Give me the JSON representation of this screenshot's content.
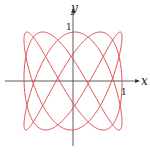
{
  "chart_data": {
    "type": "line",
    "kind": "parametric-lissajous",
    "title": "",
    "xlabel": "x",
    "ylabel": "y",
    "x_tick_labels": [
      "1"
    ],
    "y_tick_labels": [
      "1"
    ],
    "xlim": [
      -1,
      1
    ],
    "ylim": [
      -1,
      1
    ],
    "grid": false,
    "legend": null,
    "series": [
      {
        "name": "curve",
        "x_expr": "sin(3t)",
        "y_expr": "sin(5t)",
        "a": 3,
        "b": 5,
        "phase": 0.35,
        "t_range": [
          0,
          6.2832
        ],
        "color": "#e0474c"
      }
    ]
  },
  "axes": {
    "x_label": "x",
    "y_label": "y",
    "x_tick": "1",
    "y_tick": "1",
    "axis_color": "#333333"
  },
  "layout": {
    "origin": [
      73,
      81
    ],
    "radius": 49
  }
}
